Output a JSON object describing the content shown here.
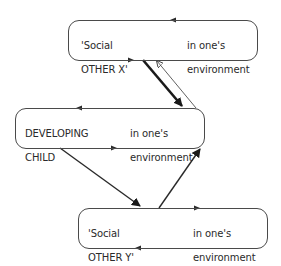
{
  "diagram": {
    "type": "relationship-diagram",
    "nodes": [
      {
        "id": "social-other-x",
        "title_line1": "'Social",
        "title_line2": "OTHER X'",
        "context_line1": "in one's",
        "context_line2": "environment"
      },
      {
        "id": "developing-child",
        "title_line1": "DEVELOPING",
        "title_line2": "CHILD",
        "context_line1": "in one's",
        "context_line2": "environment"
      },
      {
        "id": "social-other-y",
        "title_line1": "'Social",
        "title_line2": "OTHER Y'",
        "context_line1": "in one's",
        "context_line2": "environment"
      }
    ],
    "edges": [
      {
        "from": "social-other-x",
        "to": "developing-child",
        "weight": "thick"
      },
      {
        "from": "developing-child",
        "to": "social-other-x",
        "weight": "thin"
      },
      {
        "from": "developing-child",
        "to": "social-other-y",
        "weight": "medium"
      },
      {
        "from": "social-other-y",
        "to": "developing-child",
        "weight": "medium"
      }
    ],
    "colors": {
      "line": "#3a3a3a",
      "text": "#2a2a2a",
      "background": "#ffffff"
    }
  }
}
